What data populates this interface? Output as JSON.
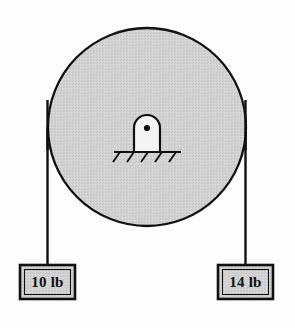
{
  "figure": {
    "type": "physics-free-body-diagram",
    "background_color": "#fdfdfd",
    "outline_color": "#111111",
    "fill_color": "#d0d0d0",
    "hub_fill_color": "#f2f2f2"
  },
  "pulley": {
    "name": "pulley-wheel",
    "center_x": 147,
    "center_y": 127,
    "radius": 99,
    "fill": "#d0d0d0",
    "stroke": "#111111",
    "stroke_width": 2.2
  },
  "hub": {
    "name": "axle-mount",
    "center_x": 147,
    "center_y": 132,
    "width": 26,
    "height": 34,
    "pin_radius": 3,
    "pin_center_x": 147,
    "pin_center_y": 128
  },
  "ground": {
    "name": "fixed-support-ground",
    "line_x1": 115,
    "line_x2": 180,
    "line_y": 152,
    "hatch_count": 5
  },
  "ropes": [
    {
      "name": "rope-left",
      "x": 47.5,
      "y_top": 127,
      "y_bottom": 265,
      "attached_to": "weight-left"
    },
    {
      "name": "rope-right",
      "x": 245.5,
      "y_top": 127,
      "y_bottom": 265,
      "attached_to": "weight-right"
    }
  ],
  "weights": [
    {
      "name": "weight-left",
      "label": "10 lb",
      "value": 10,
      "unit": "lb",
      "x": 20,
      "y": 265,
      "width": 55,
      "height": 34,
      "fill": "#d0d0d0",
      "stroke": "#111111"
    },
    {
      "name": "weight-right",
      "label": "14 lb",
      "value": 14,
      "unit": "lb",
      "x": 218,
      "y": 265,
      "width": 55,
      "height": 34,
      "fill": "#d0d0d0",
      "stroke": "#111111"
    }
  ]
}
